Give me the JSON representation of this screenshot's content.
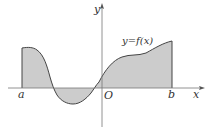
{
  "diagram": {
    "type": "function-area",
    "labels": {
      "y_axis": "y",
      "x_axis": "x",
      "origin": "O",
      "left_bound": "a",
      "right_bound": "b",
      "function": "y=f(x)"
    },
    "colors": {
      "axis": "#777777",
      "curve": "#444444",
      "fill": "#cccccc",
      "text": "#333333"
    }
  }
}
